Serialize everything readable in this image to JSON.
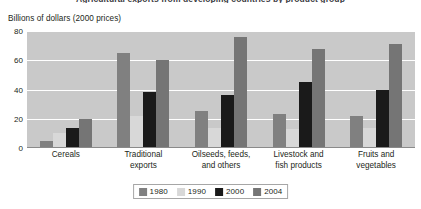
{
  "headline": "Agricultural exports from developing countries by product group",
  "chart_data": {
    "type": "bar",
    "title": "",
    "axis_title": "Billions of dollars (2000 prices)",
    "xlabel": "",
    "ylabel": "Billions of dollars (2000 prices)",
    "ylim": [
      0,
      80
    ],
    "yticks": [
      0,
      20,
      40,
      60,
      80
    ],
    "ytick_labels": [
      "0",
      "20",
      "40",
      "60",
      "80"
    ],
    "grid": true,
    "legend_position": "bottom-center",
    "categories": [
      "Cereals",
      "Traditional exports",
      "Oilseeds, feeds, and others",
      "Livestock and fish products",
      "Fruits and vegetables"
    ],
    "category_lines": [
      [
        "Cereals"
      ],
      [
        "Traditional",
        "exports"
      ],
      [
        "Oilseeds, feeds,",
        "and others"
      ],
      [
        "Livestock and",
        "fish products"
      ],
      [
        "Fruits and",
        "vegetables"
      ]
    ],
    "series": [
      {
        "name": "1980",
        "color": "#808080",
        "values": [
          5,
          65,
          25,
          23,
          22
        ]
      },
      {
        "name": "1990",
        "color": "#d8d8d8",
        "values": [
          10,
          22,
          14,
          13,
          14
        ]
      },
      {
        "name": "2000",
        "color": "#1a1a1a",
        "values": [
          14,
          38,
          36,
          45,
          40
        ]
      },
      {
        "name": "2004",
        "color": "#757575",
        "values": [
          20,
          60,
          76,
          68,
          71
        ]
      }
    ]
  },
  "colors": {
    "plot_background": "#c9c9c9",
    "gridline": "#ffffff",
    "axis": "#8a8a8a",
    "text": "#231f20",
    "legend_border": "#a6a6a6"
  }
}
